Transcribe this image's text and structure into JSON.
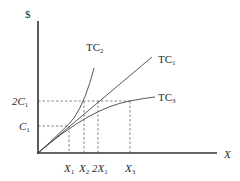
{
  "diagram": {
    "type": "cost-curves",
    "y_axis_label": "$",
    "x_axis_label": "X",
    "y_ticks": [
      {
        "main": "2C",
        "sub": "1",
        "name": "2C1"
      },
      {
        "main": "C",
        "sub": "1",
        "name": "C1"
      }
    ],
    "x_ticks": [
      {
        "main": "X",
        "sub": "1",
        "name": "X1"
      },
      {
        "main": "X",
        "sub": "2",
        "name": "X2"
      },
      {
        "main": "2X",
        "sub": "1",
        "name": "2X1"
      },
      {
        "main": "X",
        "sub": "3",
        "name": "X3"
      }
    ],
    "curves": [
      {
        "main": "TC",
        "sub": "2",
        "name": "TC2",
        "shape": "convex (increasing marginal cost)"
      },
      {
        "main": "TC",
        "sub": "1",
        "name": "TC1",
        "shape": "linear (constant marginal cost)"
      },
      {
        "main": "TC",
        "sub": "3",
        "name": "TC3",
        "shape": "concave (decreasing marginal cost)"
      }
    ]
  }
}
